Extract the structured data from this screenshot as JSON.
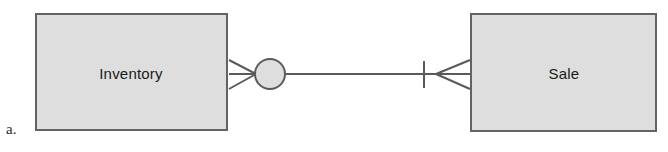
{
  "figure": {
    "label": "a.",
    "type": "entity-relationship-diagram",
    "background_color": "#ffffff"
  },
  "style": {
    "entity_fill": "#dedede",
    "entity_border": "#636363",
    "line_color": "#5a5a5a",
    "text_color": "#1a1a1a",
    "border_width": 2,
    "line_width": 2
  },
  "entities": [
    {
      "id": "inventory",
      "label": "Inventory",
      "x": 35,
      "y": 13,
      "width": 193,
      "height": 118
    },
    {
      "id": "sale",
      "label": "Sale",
      "x": 470,
      "y": 13,
      "width": 187,
      "height": 119
    }
  ],
  "relationship": {
    "from": "inventory",
    "to": "sale",
    "line": {
      "y": 74,
      "x_start": 285,
      "x_end": 435
    },
    "circle": {
      "cx": 270,
      "cy": 74,
      "r": 15,
      "meaning": "zero-optional"
    },
    "tick": {
      "x": 424,
      "y_top": 61,
      "y_bottom": 88,
      "meaning": "one-mandatory"
    },
    "crowsfoot_left": {
      "apex_x": 256,
      "base_x": 228,
      "y_top": 60,
      "y_bottom": 89,
      "meaning": "many"
    },
    "crowsfoot_right": {
      "apex_x": 436,
      "base_x": 470,
      "y_top": 60,
      "y_bottom": 89,
      "meaning": "many"
    },
    "cardinality_from": "zero-or-many",
    "cardinality_to": "one-or-many"
  }
}
